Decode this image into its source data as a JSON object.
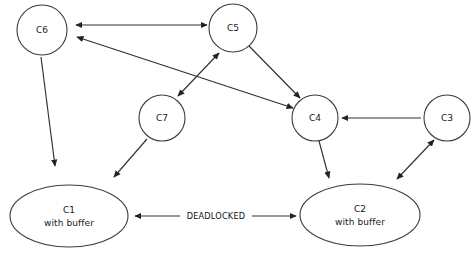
{
  "diagram": {
    "background_color": "#ffffff",
    "stroke_color": "#303030",
    "text_color": "#111111",
    "nodes": [
      {
        "id": "C6",
        "label": "C6",
        "sublabel": "",
        "shape": "circle",
        "cx": 42,
        "cy": 30,
        "r": 25
      },
      {
        "id": "C5",
        "label": "C5",
        "sublabel": "",
        "shape": "circle",
        "cx": 233,
        "cy": 28,
        "r": 24
      },
      {
        "id": "C7",
        "label": "C7",
        "sublabel": "",
        "shape": "circle",
        "cx": 162,
        "cy": 118,
        "r": 23
      },
      {
        "id": "C4",
        "label": "C4",
        "sublabel": "",
        "shape": "circle",
        "cx": 315,
        "cy": 118,
        "r": 23
      },
      {
        "id": "C3",
        "label": "C3",
        "sublabel": "",
        "shape": "circle",
        "cx": 447,
        "cy": 118,
        "r": 23
      },
      {
        "id": "C1",
        "label": "C1",
        "sublabel": "with buffer",
        "shape": "ellipse",
        "cx": 69,
        "cy": 216,
        "rx": 59,
        "ry": 31
      },
      {
        "id": "C2",
        "label": "C2",
        "sublabel": "with buffer",
        "shape": "ellipse",
        "cx": 360,
        "cy": 215,
        "rx": 60,
        "ry": 31
      }
    ],
    "edges": [
      {
        "id": "c6-c5",
        "from": "C6",
        "to": "C5",
        "direction": "both",
        "label": "",
        "x1": 76,
        "y1": 25,
        "x2": 207,
        "y2": 25
      },
      {
        "id": "c6-c4",
        "from": "C6",
        "to": "C4",
        "direction": "both",
        "label": "",
        "x1": 77,
        "y1": 37,
        "x2": 293,
        "y2": 108
      },
      {
        "id": "c7-c5",
        "from": "C7",
        "to": "C5",
        "direction": "both",
        "label": "",
        "x1": 178,
        "y1": 96,
        "x2": 219,
        "y2": 53
      },
      {
        "id": "c5-c4",
        "from": "C5",
        "to": "C4",
        "direction": "to",
        "label": "",
        "x1": 249,
        "y1": 46,
        "x2": 300,
        "y2": 98
      },
      {
        "id": "c3-c4",
        "from": "C3",
        "to": "C4",
        "direction": "to",
        "label": "",
        "x1": 421,
        "y1": 118,
        "x2": 342,
        "y2": 118
      },
      {
        "id": "c3-c2",
        "from": "C3",
        "to": "C2",
        "direction": "both",
        "label": "",
        "x1": 434,
        "y1": 140,
        "x2": 397,
        "y2": 179
      },
      {
        "id": "c4-c2",
        "from": "C4",
        "to": "C2",
        "direction": "to",
        "label": "",
        "x1": 319,
        "y1": 141,
        "x2": 329,
        "y2": 178
      },
      {
        "id": "c6-c1",
        "from": "C6",
        "to": "C1",
        "direction": "to",
        "label": "",
        "x1": 41,
        "y1": 57,
        "x2": 55,
        "y2": 166
      },
      {
        "id": "c7-c1",
        "from": "C7",
        "to": "C1",
        "direction": "to",
        "label": "",
        "x1": 147,
        "y1": 139,
        "x2": 114,
        "y2": 177
      },
      {
        "id": "c1-c2",
        "from": "C1",
        "to": "C2",
        "direction": "both",
        "label": "DEADLOCKED",
        "x1": 135,
        "y1": 216,
        "x2": 296,
        "y2": 216,
        "label_x": 216,
        "label_y": 216
      }
    ]
  }
}
